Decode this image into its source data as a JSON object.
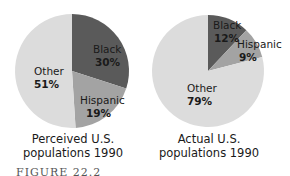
{
  "chart_data": [
    {
      "type": "pie",
      "title": "Perceived U.S. populations 1990",
      "categories": [
        "Black",
        "Hispanic",
        "Other"
      ],
      "values": [
        30,
        19,
        51
      ],
      "labels": [
        "30%",
        "19%",
        "51%"
      ],
      "colors": [
        "#5a5a5a",
        "#a3a3a3",
        "#dcdcdc"
      ]
    },
    {
      "type": "pie",
      "title": "Actual U.S. populations 1990",
      "categories": [
        "Black",
        "Hispanic",
        "Other"
      ],
      "values": [
        12,
        9,
        79
      ],
      "labels": [
        "12%",
        "9%",
        "79%"
      ],
      "colors": [
        "#5a5a5a",
        "#a3a3a3",
        "#dcdcdc"
      ]
    }
  ],
  "captions": {
    "left_line1": "Perceived U.S.",
    "left_line2": "populations 1990",
    "right_line1": "Actual U.S.",
    "right_line2": "populations 1990"
  },
  "figure_label": "FIGURE 22.2"
}
